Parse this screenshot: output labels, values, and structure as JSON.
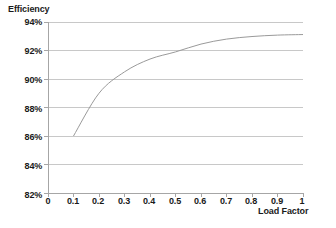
{
  "chart_data": {
    "type": "line",
    "title": "",
    "xlabel": "Load Factor",
    "ylabel": "Efficiency",
    "xlim": [
      0,
      1
    ],
    "ylim": [
      0.82,
      0.94
    ],
    "grid": true,
    "legend": "none",
    "x_ticks": [
      "0",
      "0.1",
      "0.2",
      "0.3",
      "0.4",
      "0.5",
      "0.6",
      "0.7",
      "0.8",
      "0.9",
      "1"
    ],
    "x_tick_values": [
      0,
      0.1,
      0.2,
      0.3,
      0.4,
      0.5,
      0.6,
      0.7,
      0.8,
      0.9,
      1
    ],
    "y_ticks": [
      "82%",
      "84%",
      "86%",
      "88%",
      "90%",
      "92%",
      "94%"
    ],
    "y_tick_values": [
      0.82,
      0.84,
      0.86,
      0.88,
      0.9,
      0.92,
      0.94
    ],
    "series": [
      {
        "name": "Efficiency",
        "color": "#9a9a9a",
        "x": [
          0.1,
          0.2,
          0.3,
          0.4,
          0.5,
          0.6,
          0.7,
          0.8,
          0.9,
          1.0
        ],
        "values": [
          0.86,
          0.89,
          0.905,
          0.914,
          0.919,
          0.9245,
          0.928,
          0.9298,
          0.9308,
          0.9312
        ]
      }
    ],
    "colors": {
      "line": "#9a9a9a",
      "grid": "#c8c8c8",
      "axis": "#a6a6a6",
      "text": "#1a1a1a",
      "background": "#ffffff"
    }
  }
}
